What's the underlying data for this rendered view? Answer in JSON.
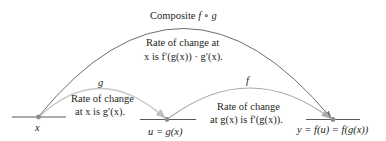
{
  "diagram": {
    "title": "Composite f ∘ g",
    "title_parts": {
      "prefix": "Composite ",
      "expr": "f ∘ g"
    },
    "composite_rate": {
      "line1": "Rate of change at",
      "line2": "x is f′(g(x)) · g′(x)."
    },
    "g_arrow": {
      "label": "g",
      "rate_line1": "Rate of change",
      "rate_line2": "at x is g′(x)."
    },
    "f_arrow": {
      "label": "f",
      "rate_line1": "Rate of change",
      "rate_line2": "at g(x) is f′(g(x))."
    },
    "points": {
      "x": "x",
      "u": "u = g(x)",
      "y": "y = f(u) = f(g(x))"
    },
    "colors": {
      "composite_arc": "#6d6e71",
      "g_arc": "#c7c8ca",
      "f_arc": "#a7a9ac",
      "axis_lines": "#58595b",
      "dots": "#8a8c8e",
      "text": "#231f20"
    }
  }
}
